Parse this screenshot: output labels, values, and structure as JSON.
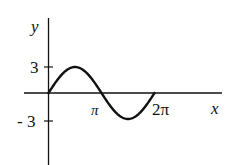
{
  "chart_data": {
    "type": "line",
    "title": "",
    "xlabel": "x",
    "ylabel": "y",
    "function": "y = 3 sin(x)",
    "x_ticks": [
      {
        "value": 3.14159,
        "label": "π"
      },
      {
        "value": 6.28318,
        "label": "2π"
      }
    ],
    "y_ticks": [
      {
        "value": 3,
        "label": "3"
      },
      {
        "value": -3,
        "label": "-3"
      }
    ],
    "xlim": [
      -1.4,
      9.3
    ],
    "ylim": [
      -6.8,
      4.2
    ],
    "grid": false,
    "legend": null,
    "series": [
      {
        "name": "3 sin x",
        "x": [
          0,
          0.785,
          1.571,
          2.356,
          3.142,
          3.927,
          4.712,
          5.498,
          6.283
        ],
        "y": [
          0,
          2.12,
          3,
          2.12,
          0,
          -2.12,
          -3,
          -2.12,
          0
        ]
      }
    ],
    "color": "#111111"
  },
  "labels": {
    "y_axis": "y",
    "x_axis": "x",
    "y_tick_pos": "3",
    "y_tick_neg": "- 3",
    "x_tick_pi": "π",
    "x_tick_2pi": "2π"
  }
}
